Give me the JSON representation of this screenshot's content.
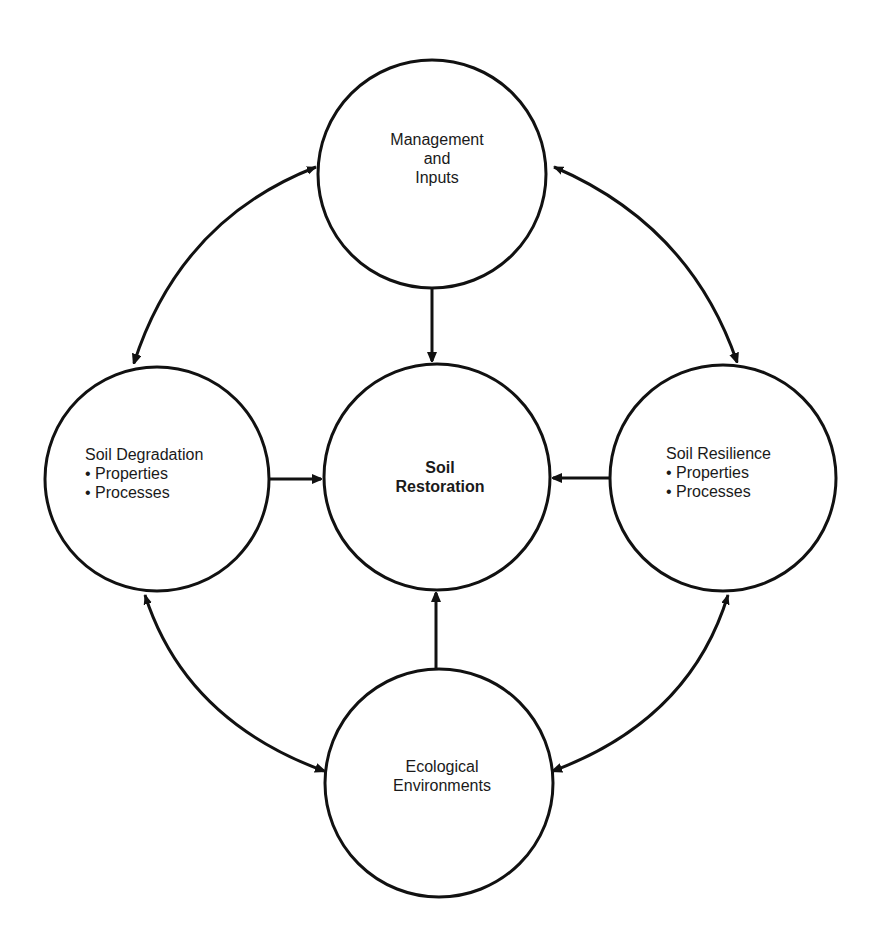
{
  "diagram": {
    "title": "",
    "nodes": {
      "management": {
        "lines": [
          "Management",
          "and",
          "Inputs"
        ],
        "bold": false
      },
      "restoration": {
        "lines": [
          "Soil",
          "Restoration"
        ],
        "bold": true
      },
      "degradation": {
        "lines": [
          "Soil Degradation",
          "• Properties",
          "• Processes"
        ],
        "bold": false
      },
      "resilience": {
        "lines": [
          "Soil Resilience",
          "• Properties",
          "• Processes"
        ],
        "bold": false
      },
      "ecological": {
        "lines": [
          "Ecological",
          "Environments"
        ],
        "bold": false
      }
    },
    "edges": [
      {
        "from": "management",
        "to": "restoration",
        "type": "one-way"
      },
      {
        "from": "degradation",
        "to": "restoration",
        "type": "one-way"
      },
      {
        "from": "resilience",
        "to": "restoration",
        "type": "one-way"
      },
      {
        "from": "ecological",
        "to": "restoration",
        "type": "one-way"
      },
      {
        "from": "management",
        "to": "degradation",
        "type": "two-way"
      },
      {
        "from": "management",
        "to": "resilience",
        "type": "two-way"
      },
      {
        "from": "degradation",
        "to": "ecological",
        "type": "two-way"
      },
      {
        "from": "resilience",
        "to": "ecological",
        "type": "two-way"
      }
    ],
    "colors": {
      "stroke": "#111111",
      "text": "#1a1a1a",
      "background": "#ffffff"
    }
  }
}
